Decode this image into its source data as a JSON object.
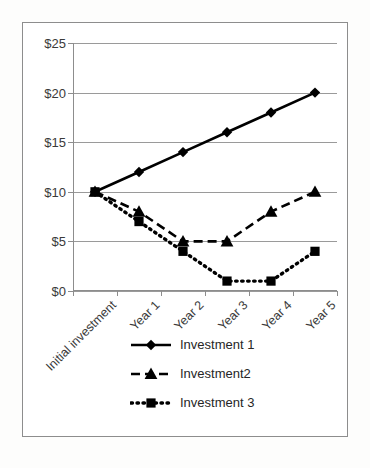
{
  "chart_data": {
    "type": "line",
    "title": "",
    "xlabel": "",
    "ylabel": "",
    "categories": [
      "Initial investment",
      "Year 1",
      "Year 2",
      "Year 3",
      "Year 4",
      "Year 5"
    ],
    "ylim": [
      0,
      25
    ],
    "ytick_labels": [
      "$0",
      "$5",
      "$10",
      "$15",
      "$20",
      "$25"
    ],
    "ytick_values": [
      0,
      5,
      10,
      15,
      20,
      25
    ],
    "grid": true,
    "legend_position": "bottom",
    "series": [
      {
        "name": "Investment 1",
        "values": [
          10,
          12,
          14,
          16,
          18,
          20
        ],
        "line_style": "solid",
        "marker": "diamond",
        "color": "#000000"
      },
      {
        "name": "Investment2",
        "values": [
          10,
          8,
          5,
          5,
          8,
          10
        ],
        "line_style": "dashed",
        "marker": "triangle",
        "color": "#000000"
      },
      {
        "name": "Investment 3",
        "values": [
          10,
          7,
          4,
          1,
          1,
          4
        ],
        "line_style": "dotted",
        "marker": "square",
        "color": "#000000"
      }
    ]
  },
  "legend": {
    "items": [
      {
        "label": "Investment 1"
      },
      {
        "label": "Investment2"
      },
      {
        "label": "Investment 3"
      }
    ]
  },
  "colors": {
    "series": "#000000",
    "gridline": "#9a9a9a",
    "axis": "#8d8d8d",
    "frame": "#8d8d8d",
    "text": "#3a3a3a",
    "background": "#ffffff"
  }
}
